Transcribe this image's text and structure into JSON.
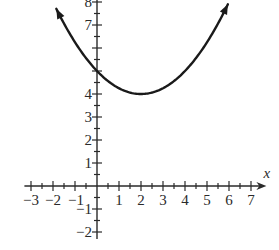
{
  "chart_data": {
    "type": "line",
    "title": "",
    "xlabel": "x",
    "ylabel": "",
    "xlim": [
      -3.3,
      7.7
    ],
    "ylim": [
      -2.3,
      8.1
    ],
    "grid": false,
    "x_ticks": [
      -3,
      -2,
      -1,
      1,
      2,
      3,
      4,
      5,
      6,
      7
    ],
    "x_tick_labels": [
      "−3",
      "−2",
      "−1",
      "1",
      "2",
      "3",
      "4",
      "5",
      "6",
      "7"
    ],
    "y_ticks": [
      -2,
      -1,
      1,
      2,
      3,
      4,
      7,
      8
    ],
    "y_tick_labels": [
      "−2",
      "−1",
      "1",
      "2",
      "3",
      "4",
      "7",
      "8"
    ],
    "minor_tick_step": 0.5,
    "series": [
      {
        "name": "parabola",
        "function": "y = 0.25*(x-2)^2 + 4",
        "vertex": [
          2,
          4
        ],
        "y_intercept": 5,
        "x_range": [
          -1.85,
          5.95
        ],
        "arrows_both_ends": true,
        "color": "#1a1a1a"
      }
    ]
  }
}
